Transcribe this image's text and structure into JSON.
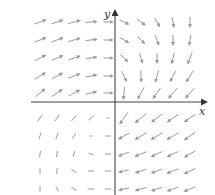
{
  "figure": {
    "type": "vector-field",
    "axes": {
      "x_label": "x",
      "y_label": "y",
      "origin_px": [
        115,
        102
      ],
      "x_axis_px": [
        31,
        206
      ],
      "y_axis_px": [
        11,
        195
      ]
    },
    "colors": {
      "axis": "#444444",
      "arrow": "#9a9a9a",
      "label": "#333333"
    },
    "grid": {
      "columns_px": [
        40,
        57,
        74,
        91,
        108,
        124,
        141,
        157,
        173,
        190
      ],
      "rows_px": [
        22,
        40,
        58,
        76,
        93,
        118,
        136,
        154,
        171,
        189
      ]
    },
    "arrows": [
      [
        [
          -20,
          12
        ],
        [
          -18,
          12
        ],
        [
          -15,
          12
        ],
        [
          -5,
          11
        ],
        [
          0,
          9
        ],
        [
          25,
          10
        ],
        [
          35,
          10
        ],
        [
          60,
          10
        ],
        [
          80,
          10
        ],
        [
          90,
          10
        ]
      ],
      [
        [
          -22,
          12
        ],
        [
          -20,
          12
        ],
        [
          -16,
          12
        ],
        [
          -6,
          11
        ],
        [
          0,
          9
        ],
        [
          30,
          10
        ],
        [
          45,
          10
        ],
        [
          70,
          10
        ],
        [
          90,
          10
        ],
        [
          100,
          10
        ]
      ],
      [
        [
          -28,
          12
        ],
        [
          -24,
          12
        ],
        [
          -18,
          12
        ],
        [
          -8,
          11
        ],
        [
          0,
          9
        ],
        [
          45,
          10
        ],
        [
          72,
          10
        ],
        [
          90,
          10
        ],
        [
          105,
          11
        ],
        [
          112,
          12
        ]
      ],
      [
        [
          -32,
          12
        ],
        [
          -28,
          12
        ],
        [
          -22,
          12
        ],
        [
          -10,
          11
        ],
        [
          0,
          9
        ],
        [
          65,
          11
        ],
        [
          88,
          11
        ],
        [
          105,
          12
        ],
        [
          118,
          12
        ],
        [
          122,
          13
        ]
      ],
      [
        [
          -40,
          12
        ],
        [
          -35,
          12
        ],
        [
          -28,
          12
        ],
        [
          -14,
          11
        ],
        [
          0,
          9
        ],
        [
          95,
          12
        ],
        [
          118,
          13
        ],
        [
          125,
          13
        ],
        [
          130,
          13
        ],
        [
          132,
          13
        ]
      ],
      [
        [
          -55,
          8
        ],
        [
          -55,
          8
        ],
        [
          -50,
          8
        ],
        [
          -40,
          7
        ],
        [
          0,
          3
        ],
        [
          125,
          14
        ],
        [
          140,
          14
        ],
        [
          142,
          13
        ],
        [
          145,
          13
        ],
        [
          145,
          13
        ]
      ],
      [
        [
          -70,
          7
        ],
        [
          -70,
          7
        ],
        [
          -60,
          6
        ],
        [
          0,
          3
        ],
        [
          0,
          6
        ],
        [
          150,
          12
        ],
        [
          148,
          13
        ],
        [
          148,
          13
        ],
        [
          150,
          13
        ],
        [
          145,
          13
        ]
      ],
      [
        [
          -80,
          6
        ],
        [
          -80,
          6
        ],
        [
          -75,
          6
        ],
        [
          20,
          5
        ],
        [
          0,
          6
        ],
        [
          160,
          11
        ],
        [
          158,
          12
        ],
        [
          155,
          12
        ],
        [
          155,
          12
        ],
        [
          150,
          12
        ]
      ],
      [
        [
          -90,
          6
        ],
        [
          -85,
          6
        ],
        [
          30,
          6
        ],
        [
          0,
          6
        ],
        [
          0,
          7
        ],
        [
          165,
          10
        ],
        [
          162,
          11
        ],
        [
          160,
          11
        ],
        [
          158,
          12
        ],
        [
          155,
          12
        ]
      ],
      [
        [
          -90,
          6
        ],
        [
          60,
          5
        ],
        [
          30,
          6
        ],
        [
          0,
          7
        ],
        [
          0,
          7
        ],
        [
          168,
          10
        ],
        [
          165,
          11
        ],
        [
          162,
          11
        ],
        [
          160,
          11
        ],
        [
          158,
          12
        ]
      ]
    ]
  }
}
